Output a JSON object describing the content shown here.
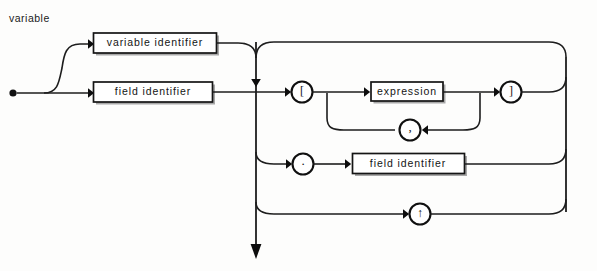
{
  "diagram": {
    "title": "variable",
    "type": "railroad-syntax-diagram",
    "colors": {
      "line": "#1d1d1d",
      "box_fill": "#ffffff",
      "box_stroke": "#151515",
      "text": "#141414",
      "background": "#fdfdfc",
      "box_shadow": "#a8a8a8"
    },
    "nonterminals": {
      "variable_identifier": "variable identifier",
      "field_identifier_top": "field identifier",
      "expression": "expression",
      "field_identifier_bottom": "field identifier"
    },
    "terminals": {
      "open_bracket": "[",
      "close_bracket": "]",
      "comma": ",",
      "period": ".",
      "caret": "↑"
    },
    "paths": [
      "start → variable identifier → suffix bus",
      "start → field identifier → suffix bus",
      "suffix bus → [ → expression (, repeat) → ] → return",
      "suffix bus → . → field identifier → return",
      "suffix bus → ↑ → return",
      "suffix bus → exit (down arrow)"
    ]
  }
}
